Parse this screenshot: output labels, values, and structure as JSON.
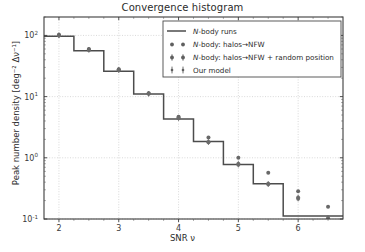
{
  "chart_data": {
    "type": "line",
    "title": "Convergence histogram",
    "xlabel": "SNR ν",
    "ylabel": "Peak number density [deg⁻² Δν⁻¹]",
    "ylabel_main": "Peak number density",
    "ylabel_units": "[deg⁻² Δν⁻¹]",
    "xlim": [
      1.75,
      6.75
    ],
    "ylim": [
      0.1,
      200
    ],
    "yscale": "log",
    "xscale": "linear",
    "grid": true,
    "grid_style": "dotted",
    "legend_position": "upper right",
    "xticks": [
      2,
      3,
      4,
      5,
      6
    ],
    "xtick_labels": [
      "2",
      "3",
      "4",
      "5",
      "6"
    ],
    "yticks": [
      0.1,
      1,
      10,
      100
    ],
    "ytick_labels": [
      "10⁻¹",
      "10⁰",
      "10¹",
      "10²"
    ],
    "ytick_mantissas": [
      "10",
      "10",
      "10",
      "10"
    ],
    "ytick_exponents": [
      "-1",
      "0",
      "1",
      "2"
    ],
    "series": [
      {
        "name": "N-body runs",
        "type": "step",
        "marker": "line",
        "color": "#4c4c4c",
        "bin_edges": [
          1.75,
          2.25,
          2.75,
          3.25,
          3.75,
          4.25,
          4.75,
          5.25,
          5.75,
          6.75
        ],
        "bin_centers": [
          2.0,
          2.5,
          3.0,
          3.5,
          4.0,
          4.5,
          5.0,
          5.5,
          6.25
        ],
        "values": [
          97.0,
          56.0,
          26.0,
          11.0,
          4.3,
          1.85,
          0.78,
          0.375,
          0.112
        ]
      },
      {
        "name": "N-body: halos→NFW",
        "type": "scatter",
        "marker": "circle",
        "color": "#5b5b5b",
        "x": [
          2.0,
          2.5,
          3.0,
          3.5,
          4.0,
          4.5,
          5.0,
          5.5,
          6.0,
          6.5
        ],
        "y": [
          103.0,
          60.0,
          28.0,
          11.4,
          4.7,
          2.15,
          1.0,
          0.57,
          0.285,
          0.158
        ]
      },
      {
        "name": "N-body: halos→NFW + random position",
        "type": "scatter",
        "marker": "circle-errorbar",
        "color": "#6a6a6a",
        "x": [
          2.0,
          2.5,
          3.0,
          3.5,
          4.0,
          4.5,
          5.0,
          5.5,
          6.0,
          6.5
        ],
        "y": [
          101.0,
          58.0,
          27.0,
          11.1,
          4.45,
          1.82,
          0.8,
          0.375,
          0.225,
          0.105
        ]
      },
      {
        "name": "Our model",
        "type": "scatter",
        "marker": "errorbar",
        "color": "#6a6a6a",
        "x": [
          2.0,
          2.5,
          3.0,
          3.5,
          4.0,
          4.5,
          5.0,
          5.5,
          6.0,
          6.5
        ],
        "y": [
          100.0,
          58.5,
          27.5,
          11.2,
          4.5,
          1.8,
          0.77,
          0.37,
          0.215,
          0.098
        ]
      }
    ]
  },
  "legend": {
    "entries": [
      {
        "label": "N-body runs",
        "label_prefix": "N",
        "label_rest": "-body runs",
        "marker": "line"
      },
      {
        "label": "N-body: halos→NFW",
        "label_prefix": "N",
        "label_rest": "-body: halos→NFW",
        "marker": "dots"
      },
      {
        "label": "N-body: halos→NFW + random position",
        "label_prefix": "N",
        "label_rest": "-body: halos→NFW + random position",
        "marker": "dots-errorbar"
      },
      {
        "label": "Our model",
        "label_prefix": "",
        "label_rest": "Our model",
        "marker": "errorbars"
      }
    ]
  },
  "colors": {
    "line": "#4c4c4c",
    "marker": "#5f5f5f",
    "grid": "#c9c9c9",
    "frame": "#3c3c3c",
    "text": "#2b2b2b",
    "background": "#ffffff"
  }
}
